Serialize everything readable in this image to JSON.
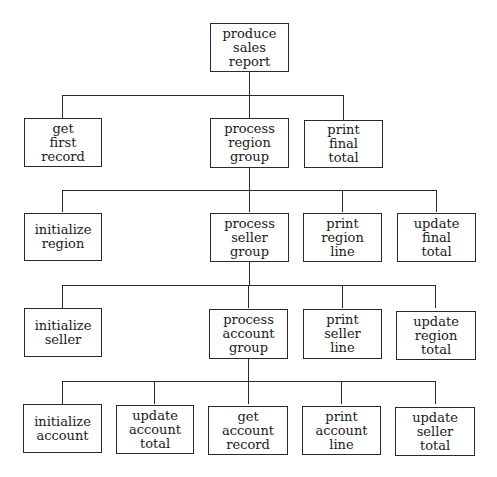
{
  "diagram": {
    "type": "structure-chart",
    "nodes": {
      "root": {
        "lines": [
          "produce",
          "sales",
          "report"
        ]
      },
      "n1_1": {
        "lines": [
          "get",
          "first",
          "record"
        ]
      },
      "n1_2": {
        "lines": [
          "process",
          "region",
          "group"
        ]
      },
      "n1_3": {
        "lines": [
          "print",
          "final",
          "total"
        ]
      },
      "n2_1": {
        "lines": [
          "initialize",
          "region"
        ]
      },
      "n2_2": {
        "lines": [
          "process",
          "seller",
          "group"
        ]
      },
      "n2_3": {
        "lines": [
          "print",
          "region",
          "line"
        ]
      },
      "n2_4": {
        "lines": [
          "update",
          "final",
          "total"
        ]
      },
      "n3_1": {
        "lines": [
          "initialize",
          "seller"
        ]
      },
      "n3_2": {
        "lines": [
          "process",
          "account",
          "group"
        ]
      },
      "n3_3": {
        "lines": [
          "print",
          "seller",
          "line"
        ]
      },
      "n3_4": {
        "lines": [
          "update",
          "region",
          "total"
        ]
      },
      "n4_1": {
        "lines": [
          "initialize",
          "account"
        ]
      },
      "n4_2": {
        "lines": [
          "update",
          "account",
          "total"
        ]
      },
      "n4_3": {
        "lines": [
          "get",
          "account",
          "record"
        ]
      },
      "n4_4": {
        "lines": [
          "print",
          "account",
          "line"
        ]
      },
      "n4_5": {
        "lines": [
          "update",
          "seller",
          "total"
        ]
      }
    },
    "edges": [
      [
        "produce sales report",
        "get first record"
      ],
      [
        "produce sales report",
        "process region group"
      ],
      [
        "produce sales report",
        "print final total"
      ],
      [
        "process region group",
        "initialize region"
      ],
      [
        "process region group",
        "process seller group"
      ],
      [
        "process region group",
        "print region line"
      ],
      [
        "process region group",
        "update final total"
      ],
      [
        "process seller group",
        "initialize seller"
      ],
      [
        "process seller group",
        "process account group"
      ],
      [
        "process seller group",
        "print seller line"
      ],
      [
        "process seller group",
        "update region total"
      ],
      [
        "process account group",
        "initialize account"
      ],
      [
        "process account group",
        "update account total"
      ],
      [
        "process account group",
        "get account record"
      ],
      [
        "process account group",
        "print account line"
      ],
      [
        "process account group",
        "update seller total"
      ]
    ],
    "colors": {
      "line": "#2a2a2a",
      "text": "#1a1a1a",
      "background": "#ffffff"
    }
  }
}
